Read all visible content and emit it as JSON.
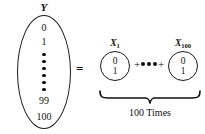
{
  "diagram": {
    "type": "math-identity",
    "relation_operator": "=",
    "left_side": {
      "variable_label": "Y",
      "shape": "ellipse",
      "values": [
        "0",
        "1",
        "99",
        "100"
      ],
      "value_top_1": "0",
      "value_top_2": "1",
      "value_bottom_1": "99",
      "value_bottom_2": "100",
      "vertical_ellipsis_dot_count": 6
    },
    "right_side": {
      "first_term": {
        "variable_label": "X",
        "subscript": "1",
        "shape": "circle",
        "value_top": "0",
        "value_bottom": "1"
      },
      "last_term": {
        "variable_label": "X",
        "subscript": "100",
        "shape": "circle",
        "value_top": "0",
        "value_bottom": "1"
      },
      "operator_left": "+",
      "operator_right": "+",
      "horizontal_ellipsis_dot_count": 3,
      "brace_caption": "100 Times"
    },
    "colors": {
      "ink": "#111111",
      "stroke": "#1a1a1a",
      "background": "#ffffff"
    }
  }
}
